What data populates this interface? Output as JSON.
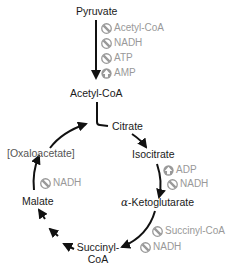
{
  "diagram": {
    "colors": {
      "metabolite_text": "#1a1a1a",
      "regulator_text": "#999999",
      "arrow": "#111111",
      "icon_fill": "#999999"
    },
    "metabolites": {
      "pyruvate": "Pyruvate",
      "acetyl_coa": "Acetyl-CoA",
      "citrate": "Citrate",
      "isocitrate": "Isocitrate",
      "alpha_ketoglutarate": "α-Ketoglutarate",
      "succinyl_coa_line1": "Succinyl-",
      "succinyl_coa_line2": "CoA",
      "malate": "Malate",
      "oxaloacetate": "[Oxaloacetate]"
    },
    "regulators": {
      "pdh": [
        {
          "label": "Acetyl-CoA",
          "effect": "inhibit",
          "icon": "inhibit-icon"
        },
        {
          "label": "NADH",
          "effect": "inhibit",
          "icon": "inhibit-icon"
        },
        {
          "label": "ATP",
          "effect": "inhibit",
          "icon": "inhibit-icon"
        },
        {
          "label": "AMP",
          "effect": "activate",
          "icon": "activate-arrow-icon"
        }
      ],
      "isocitrate_dh": [
        {
          "label": "ADP",
          "effect": "activate",
          "icon": "activate-arrow-icon"
        },
        {
          "label": "NADH",
          "effect": "inhibit",
          "icon": "inhibit-icon"
        }
      ],
      "akg_dh": [
        {
          "label": "Succinyl-CoA",
          "effect": "inhibit",
          "icon": "inhibit-icon"
        },
        {
          "label": "NADH",
          "effect": "inhibit",
          "icon": "inhibit-icon"
        }
      ],
      "malate_dh": [
        {
          "label": "NADH",
          "effect": "inhibit",
          "icon": "inhibit-icon"
        }
      ]
    }
  }
}
